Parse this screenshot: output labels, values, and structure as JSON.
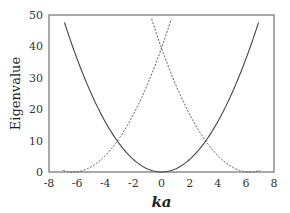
{
  "chart_data": {
    "type": "line",
    "title": "",
    "xlabel": "ka",
    "ylabel": "Eigenvalue",
    "xlim": [
      -8,
      8
    ],
    "ylim": [
      0,
      50
    ],
    "xticks": [
      -8,
      -6,
      -4,
      -2,
      0,
      2,
      4,
      6,
      8
    ],
    "yticks": [
      0,
      10,
      20,
      30,
      40,
      50
    ],
    "grid": false,
    "legend": null,
    "series": [
      {
        "name": "(ka)^2",
        "style": "solid",
        "x": [
          -6.9,
          -6,
          -4,
          -3.14,
          -2,
          0,
          2,
          3.14,
          4,
          6,
          6.9
        ],
        "y": [
          47.6,
          36,
          16,
          9.87,
          4,
          0,
          4,
          9.87,
          16,
          36,
          47.6
        ]
      },
      {
        "name": "(ka - 2pi)^2",
        "style": "dashed",
        "x": [
          -0.7,
          0,
          2,
          3.14,
          4,
          6.28,
          7
        ],
        "y": [
          48.8,
          39.5,
          17.9,
          9.87,
          5.2,
          0,
          0.5
        ]
      },
      {
        "name": "(ka + 2pi)^2",
        "style": "dashed",
        "x": [
          -7,
          -6.28,
          -4,
          -3.14,
          -2,
          0,
          0.7
        ],
        "y": [
          0.5,
          0,
          5.2,
          9.87,
          17.9,
          39.5,
          48.8
        ]
      }
    ],
    "annotations": []
  }
}
